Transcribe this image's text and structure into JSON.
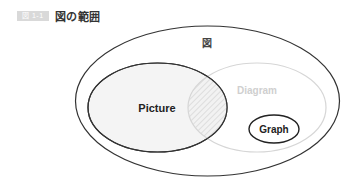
{
  "header": {
    "badge": "図 1-1",
    "title": "図の範囲"
  },
  "diagram": {
    "outer_label": "図",
    "sets": [
      {
        "name": "Picture",
        "cx": 157.5,
        "cy": 107.5,
        "rx": 69.5,
        "ry": 44.5,
        "stroke": "#333333",
        "fill": "#f4f4f4"
      },
      {
        "name": "Diagram",
        "cx": 257,
        "cy": 107.5,
        "rx": 69,
        "ry": 44.5,
        "stroke": "#d6d6d6",
        "fill": "none"
      },
      {
        "name": "Graph",
        "cx": 274,
        "cy": 129,
        "rx": 25,
        "ry": 14,
        "stroke": "#222222",
        "fill": "#ffffff"
      }
    ],
    "outer": {
      "cx": 207.5,
      "cy": 101,
      "rx": 132,
      "ry": 75,
      "stroke": "#333333"
    },
    "intersection_pattern": "hatched"
  },
  "labels": {
    "picture": "Picture",
    "diagram": "Diagram",
    "graph": "Graph",
    "outer": "図"
  },
  "colors": {
    "dark_stroke": "#333333",
    "light_stroke": "#d6d6d6",
    "diagram_text": "#d0d0d0",
    "badge_bg": "#d9d9d9"
  }
}
